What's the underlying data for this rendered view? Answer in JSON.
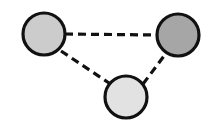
{
  "figure": {
    "title": "",
    "background_color": "#ffffff",
    "width": 213,
    "height": 124
  },
  "chart_data": {
    "type": "diagram",
    "diagram_kind": "undirected-graph-triangle",
    "title": "",
    "xlabel": "",
    "ylabel": "",
    "grid": false,
    "legend": false,
    "background": "#ffffff",
    "node_count": 3,
    "edge_count": 3,
    "nodes": [
      {
        "id": "node-left",
        "label": "",
        "cx": 44,
        "cy": 34,
        "r": 21,
        "fill": "#cccccc",
        "stroke": "#111111",
        "stroke_width": 3.2,
        "shade": "light-gray"
      },
      {
        "id": "node-right",
        "label": "",
        "cx": 178,
        "cy": 35,
        "r": 21,
        "fill": "#a6a6a6",
        "stroke": "#111111",
        "stroke_width": 3.2,
        "shade": "medium-gray"
      },
      {
        "id": "node-bottom",
        "label": "",
        "cx": 126,
        "cy": 97,
        "r": 21,
        "fill": "#e2e2e2",
        "stroke": "#111111",
        "stroke_width": 3.2,
        "shade": "very-light-gray"
      }
    ],
    "edges": [
      {
        "id": "edge-left-right",
        "from": "node-left",
        "to": "node-right",
        "style": "dashed",
        "color": "#111111",
        "width": 3.2,
        "dash": "8,5",
        "x1": 65,
        "y1": 34,
        "x2": 157,
        "y2": 35
      },
      {
        "id": "edge-left-bottom",
        "from": "node-left",
        "to": "node-bottom",
        "style": "dashed",
        "color": "#111111",
        "width": 3.2,
        "dash": "8,5",
        "x1": 61,
        "y1": 51,
        "x2": 109,
        "y2": 83
      },
      {
        "id": "edge-bottom-right",
        "from": "node-bottom",
        "to": "node-right",
        "style": "dashed",
        "color": "#111111",
        "width": 3.2,
        "dash": "8,5",
        "x1": 143,
        "y1": 84,
        "x2": 167,
        "y2": 52
      }
    ]
  }
}
